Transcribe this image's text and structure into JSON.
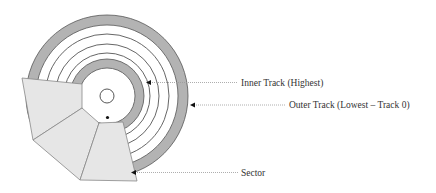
{
  "diagram": {
    "labels": {
      "inner_track": "Inner Track (Highest)",
      "outer_track": "Outer Track (Lowest – Track 0)",
      "sector": "Sector"
    },
    "colors": {
      "band_fill": "#b3b3b3",
      "sector_fill": "#e6e6e6",
      "stroke": "#555555",
      "leader": "#999999",
      "text": "#333333"
    },
    "track_count_thin": 3,
    "highlighted_bands": [
      "outer-track",
      "inner-track"
    ],
    "sector_count": 3
  }
}
